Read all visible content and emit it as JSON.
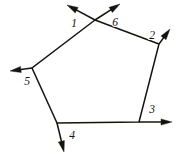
{
  "figure": {
    "name": "pentagon-exterior-angles",
    "width": 176,
    "height": 160,
    "background_color": "#ffffff",
    "ink_color": "#16130f",
    "stroke_width": 1.5
  },
  "polygon": {
    "sides": 5,
    "closed": true,
    "vertices": [
      {
        "id": "apex",
        "x": 95,
        "y": 20
      },
      {
        "id": "right",
        "x": 159,
        "y": 44
      },
      {
        "id": "bottom-right",
        "x": 139,
        "y": 122
      },
      {
        "id": "bottom-left",
        "x": 57,
        "y": 123
      },
      {
        "id": "left",
        "x": 32,
        "y": 68
      }
    ],
    "edges": [
      {
        "id": "edge-apex-right",
        "from": "apex",
        "to": "right"
      },
      {
        "id": "edge-right-bottomright",
        "from": "right",
        "to": "bottom-right"
      },
      {
        "id": "edge-bottomright-bottomleft",
        "from": "bottom-right",
        "to": "bottom-left"
      },
      {
        "id": "edge-bottomleft-left",
        "from": "bottom-left",
        "to": "left"
      },
      {
        "id": "edge-left-apex",
        "from": "left",
        "to": "apex"
      }
    ]
  },
  "rays": [
    {
      "label": "1",
      "from_vertex": "apex",
      "start_x": 95,
      "start_y": 20,
      "tip_x": 67,
      "tip_y": 5,
      "direction": "up-left",
      "label_x": 74,
      "label_y": 24
    },
    {
      "label": "2",
      "from_vertex": "right",
      "start_x": 159,
      "start_y": 44,
      "tip_x": 170,
      "tip_y": 29,
      "direction": "up-right",
      "label_x": 152,
      "label_y": 36
    },
    {
      "label": "3",
      "from_vertex": "bottom-right",
      "start_x": 139,
      "start_y": 122,
      "tip_x": 172,
      "tip_y": 122,
      "direction": "right",
      "label_x": 152,
      "label_y": 110
    },
    {
      "label": "4",
      "from_vertex": "bottom-left",
      "start_x": 57,
      "start_y": 123,
      "tip_x": 64,
      "tip_y": 152,
      "direction": "down",
      "label_x": 72,
      "label_y": 136
    },
    {
      "label": "5",
      "from_vertex": "left",
      "start_x": 32,
      "start_y": 68,
      "tip_x": 10,
      "tip_y": 71,
      "direction": "down-left",
      "label_x": 27,
      "label_y": 82
    },
    {
      "label": "6",
      "from_vertex": "apex",
      "start_x": 95,
      "start_y": 20,
      "tip_x": 120,
      "tip_y": 4,
      "direction": "up-right",
      "label_x": 115,
      "label_y": 23
    }
  ],
  "labels": {
    "angle_1": "1",
    "angle_2": "2",
    "angle_3": "3",
    "angle_4": "4",
    "angle_5": "5",
    "angle_6": "6"
  }
}
